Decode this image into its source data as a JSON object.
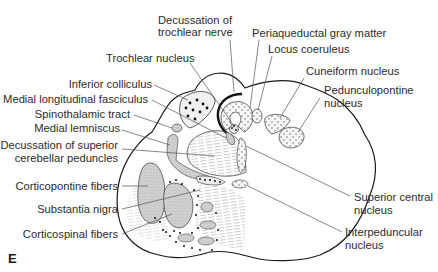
{
  "figure": {
    "panel_letter": "E"
  },
  "labels": {
    "decussation_trochlear": [
      "Decussation of",
      "trochlear nerve"
    ],
    "periaqueductal": "Periaqueductal gray matter",
    "locus_coeruleus": "Locus coeruleus",
    "trochlear_nucleus": "Trochlear nucleus",
    "cuneiform": "Cuneiform nucleus",
    "pedunculopontine": [
      "Pedunculopontine",
      "nucleus"
    ],
    "inferior_colliculus": "Inferior colliculus",
    "mlf": "Medial longitudinal fasciculus",
    "spinothalamic": "Spinothalamic tract",
    "medial_lemniscus": "Medial lemniscus",
    "decussation_scp": [
      "Decussation of superior",
      "cerebellar peduncles"
    ],
    "corticopontine": "Corticopontine fibers",
    "substantia_nigra": "Substantia nigra",
    "corticospinal": "Corticospinal fibers",
    "superior_central": [
      "Superior central",
      "nucleus"
    ],
    "interpeduncular": [
      "Interpeduncular",
      "nucleus"
    ]
  },
  "colors": {
    "outline": "#1a1a1a",
    "leader_line": "#555555",
    "stipple_fill": "#cfcfcf",
    "dotted_fill": "#f2f2f2",
    "text": "#2b2b2b"
  }
}
